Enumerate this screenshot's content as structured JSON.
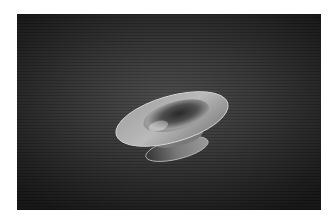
{
  "scene": {
    "subject": "wireframe bowl render",
    "colors": {
      "page_border": "#ffffff",
      "background_center": "#4a4a4a",
      "background_edge": "#141414",
      "mesh_light": "#d8d8d8",
      "mesh_mid": "#9a9a9a",
      "mesh_dark": "#3a3a3a"
    }
  }
}
